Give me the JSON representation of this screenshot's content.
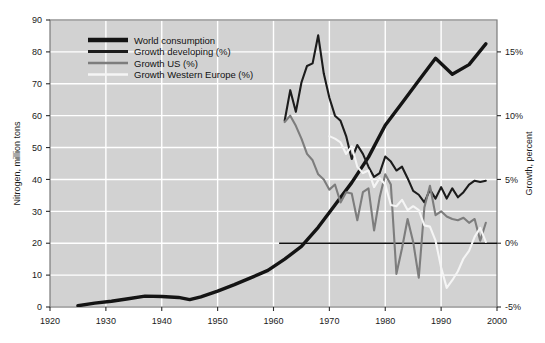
{
  "chart_data": {
    "type": "line",
    "title": "",
    "xlabel": "",
    "ylabel": "Nitrogen, million tons",
    "y2label": "Growth, percent",
    "xlim": [
      1920,
      2000
    ],
    "ylim": [
      0,
      90
    ],
    "y2lim": [
      -5,
      17.5
    ],
    "grid": true,
    "legend_position": "top-left",
    "plot_background": "#d2d2d2",
    "gridline_color": "#ffffff",
    "x_ticks": [
      1920,
      1930,
      1940,
      1950,
      1960,
      1970,
      1980,
      1990,
      2000
    ],
    "x_tick_labels": [
      "1920",
      "1930",
      "1940",
      "1950",
      "1960",
      "1970",
      "1980",
      "1990",
      "2000"
    ],
    "y_ticks": [
      0,
      10,
      20,
      30,
      40,
      50,
      60,
      70,
      80,
      90
    ],
    "y_tick_labels": [
      "0",
      "10",
      "20",
      "30",
      "40",
      "50",
      "60",
      "70",
      "80",
      "90"
    ],
    "y2_ticks": [
      -5,
      0,
      5,
      10,
      15
    ],
    "y2_tick_labels": [
      "-5%",
      "0%",
      "5%",
      "10%",
      "15%"
    ],
    "zero_reference_line": {
      "value": 0,
      "axis": "right",
      "x_start": 1961,
      "x_end": 2000,
      "color": "#111111"
    },
    "series": [
      {
        "name": "World consumption",
        "legend_label": "World consumption",
        "axis": "left",
        "color": "#141414",
        "width": 3.4,
        "x": [
          1925,
          1928,
          1931,
          1934,
          1937,
          1940,
          1943,
          1945,
          1947,
          1950,
          1953,
          1956,
          1959,
          1962,
          1965,
          1968,
          1971,
          1974,
          1977,
          1980,
          1983,
          1986,
          1989,
          1992,
          1995,
          1998
        ],
        "values": [
          0.4,
          1.2,
          1.8,
          2.6,
          3.4,
          3.3,
          3.0,
          2.3,
          3.2,
          5.0,
          7.0,
          9.2,
          11.5,
          15.0,
          19.0,
          25.0,
          32.0,
          39.0,
          47.0,
          57.0,
          64.0,
          71.0,
          78.0,
          73.0,
          76.0,
          82.5
        ]
      },
      {
        "name": "Growth developing (%)",
        "legend_label": "Growth developing (%)",
        "axis": "right",
        "color": "#1c1c1c",
        "width": 2.1,
        "x": [
          1962,
          1963,
          1964,
          1965,
          1966,
          1967,
          1968,
          1969,
          1970,
          1971,
          1972,
          1973,
          1974,
          1975,
          1976,
          1977,
          1978,
          1979,
          1980,
          1981,
          1982,
          1983,
          1984,
          1985,
          1986,
          1987,
          1988,
          1989,
          1990,
          1991,
          1992,
          1993,
          1994,
          1995,
          1996,
          1997,
          1998
        ],
        "values": [
          9.6,
          12.0,
          10.3,
          12.6,
          13.9,
          14.1,
          16.3,
          13.3,
          11.4,
          10.0,
          9.6,
          8.4,
          6.6,
          7.7,
          7.0,
          6.0,
          5.2,
          5.5,
          6.8,
          6.4,
          5.7,
          6.0,
          5.1,
          4.1,
          3.8,
          3.2,
          4.2,
          3.5,
          4.4,
          3.5,
          4.3,
          3.6,
          4.0,
          4.6,
          4.9,
          4.8,
          4.9
        ]
      },
      {
        "name": "Growth US (%)",
        "legend_label": "Growth US (%)",
        "axis": "right",
        "color": "#7d7d7d",
        "width": 2.1,
        "x": [
          1962,
          1963,
          1964,
          1965,
          1966,
          1967,
          1968,
          1969,
          1970,
          1971,
          1972,
          1973,
          1974,
          1975,
          1976,
          1977,
          1978,
          1979,
          1980,
          1981,
          1982,
          1983,
          1984,
          1985,
          1986,
          1987,
          1988,
          1989,
          1990,
          1991,
          1992,
          1993,
          1994,
          1995,
          1996,
          1997,
          1998
        ],
        "values": [
          9.5,
          10.0,
          9.2,
          8.2,
          7.0,
          6.5,
          5.4,
          5.0,
          4.2,
          4.6,
          3.2,
          4.0,
          3.9,
          1.8,
          4.0,
          4.3,
          1.0,
          3.6,
          5.4,
          4.6,
          -2.4,
          -0.4,
          1.9,
          0.1,
          -2.7,
          2.8,
          4.5,
          2.2,
          2.5,
          2.1,
          1.9,
          1.8,
          2.0,
          1.6,
          1.9,
          0.2,
          1.6
        ]
      },
      {
        "name": "Growth Western Europe (%)",
        "legend_label": "Growth Western Europe (%)",
        "axis": "right",
        "color": "#f5f5f5",
        "width": 2.1,
        "x": [
          1970,
          1971,
          1972,
          1973,
          1974,
          1975,
          1976,
          1977,
          1978,
          1979,
          1980,
          1981,
          1982,
          1983,
          1984,
          1985,
          1986,
          1987,
          1988,
          1989,
          1990,
          1991,
          1992,
          1993,
          1994,
          1995,
          1996,
          1997,
          1998
        ],
        "values": [
          8.4,
          8.2,
          7.9,
          7.0,
          7.6,
          6.0,
          5.5,
          5.7,
          4.4,
          5.1,
          4.6,
          3.0,
          2.9,
          3.4,
          2.6,
          2.9,
          2.6,
          1.4,
          1.3,
          0.2,
          -1.9,
          -3.5,
          -2.9,
          -2.2,
          -1.2,
          -0.6,
          0.5,
          1.2,
          0.1
        ]
      }
    ]
  },
  "legend": {
    "items": [
      {
        "label": "World consumption",
        "color": "#141414",
        "thickness": 4.5
      },
      {
        "label": "Growth developing (%)",
        "color": "#1c1c1c",
        "thickness": 3.0
      },
      {
        "label": "Growth US (%)",
        "color": "#7d7d7d",
        "thickness": 2.4
      },
      {
        "label": "Growth Western Europe (%)",
        "color": "#f5f5f5",
        "thickness": 2.4
      }
    ]
  },
  "axes": {
    "left_title": "Nitrogen, million tons",
    "right_title": "Growth, percent"
  }
}
